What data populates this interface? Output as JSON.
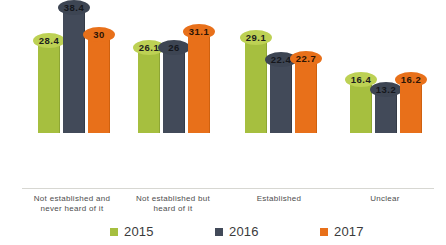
{
  "chart_data": {
    "type": "bar",
    "title": "",
    "xlabel": "",
    "ylabel": "",
    "ylim": [
      0,
      40
    ],
    "grid": false,
    "legend_position": "bottom",
    "categories": [
      "Not established and never heard of it",
      "Not established but heard of it",
      "Established",
      "Unclear"
    ],
    "series": [
      {
        "name": "2015",
        "color": "#a6bf3f",
        "values": [
          28.4,
          26.1,
          29.1,
          16.4
        ]
      },
      {
        "name": "2016",
        "color": "#424a59",
        "values": [
          38.4,
          26,
          22.4,
          13.2
        ]
      },
      {
        "name": "2017",
        "color": "#e8701a",
        "values": [
          31.1,
          31.1,
          22.7,
          16.2
        ]
      }
    ],
    "data_labels": [
      [
        "28.4",
        "38.4",
        "30"
      ],
      [
        "26.1",
        "26",
        "31.1"
      ],
      [
        "29.1",
        "22.4",
        "22.7"
      ],
      [
        "16.4",
        "13.2",
        "16.2"
      ]
    ],
    "bar_values": [
      [
        28.4,
        38.4,
        30
      ],
      [
        26.1,
        26,
        31.1
      ],
      [
        29.1,
        22.4,
        22.7
      ],
      [
        16.4,
        13.2,
        16.2
      ]
    ]
  },
  "legend": {
    "items": [
      {
        "label": "2015",
        "color": "#a6bf3f"
      },
      {
        "label": "2016",
        "color": "#424a59"
      },
      {
        "label": "2017",
        "color": "#e8701a"
      }
    ]
  },
  "axis": {
    "categories": [
      {
        "line1": "Not established and",
        "line2": "never heard of it"
      },
      {
        "line1": "Not established but",
        "line2": "heard of it"
      },
      {
        "line1": "Established",
        "line2": ""
      },
      {
        "line1": "Unclear",
        "line2": ""
      }
    ]
  }
}
